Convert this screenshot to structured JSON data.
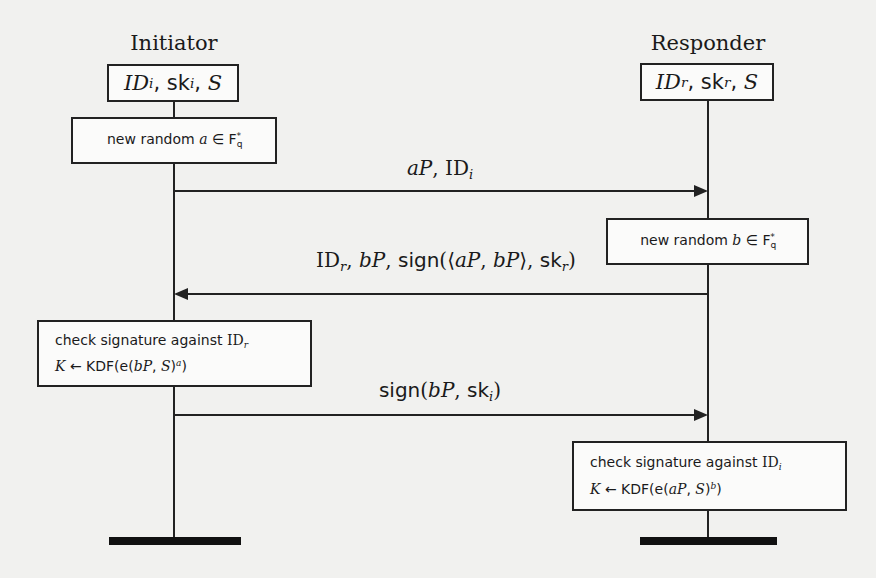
{
  "diagram": {
    "type": "protocol-sequence",
    "colors": {
      "background": "#f1f1ef",
      "line": "#222222",
      "box_fill": "#fbfbfa"
    },
    "initiator": {
      "title": "Initiator",
      "state": {
        "id": "ID",
        "id_sub": "i",
        "sk": "sk",
        "sk_sub": "i",
        "s": "S",
        "display": "IDi, ski, S"
      },
      "step1": {
        "text": "new random",
        "var": "a",
        "in": "∈",
        "field": "F",
        "field_sub": "q",
        "field_sup": "*",
        "display": "new random a ∈ Fq*"
      },
      "step2": {
        "line1": {
          "text": "check signature against",
          "id": "ID",
          "id_sub": "r"
        },
        "line2": {
          "k": "K",
          "arrow": "←",
          "kdf": "KDF(e(",
          "arg1": "bP",
          "sep": ", ",
          "arg2": "S",
          "close": ")",
          "exp": "a",
          "end": ")"
        },
        "display": "check signature against IDr; K ← KDF(e(bP, S)^a)"
      }
    },
    "responder": {
      "title": "Responder",
      "state": {
        "id": "ID",
        "id_sub": "r",
        "sk": "sk",
        "sk_sub": "r",
        "s": "S",
        "display": "IDr, skr, S"
      },
      "step1": {
        "text": "new random",
        "var": "b",
        "in": "∈",
        "field": "F",
        "field_sub": "q",
        "field_sup": "*",
        "display": "new random b ∈ Fq*"
      },
      "step2": {
        "line1": {
          "text": "check signature against",
          "id": "ID",
          "id_sub": "i"
        },
        "line2": {
          "k": "K",
          "arrow": "←",
          "kdf": "KDF(e(",
          "arg1": "aP",
          "sep": ", ",
          "arg2": "S",
          "close": ")",
          "exp": "b",
          "end": ")"
        },
        "display": "check signature against IDi; K ← KDF(e(aP, S)^b)"
      }
    },
    "messages": [
      {
        "direction": "initiator-to-responder",
        "p1": "aP",
        "sep": ", ",
        "id": "ID",
        "id_sub": "i",
        "display": "aP, IDi"
      },
      {
        "direction": "responder-to-initiator",
        "id": "ID",
        "id_sub": "r",
        "sep1": ", ",
        "bp": "bP",
        "sep2": ", ",
        "sign": "sign",
        "open": "(⟨",
        "ap": "aP",
        "comma": ", ",
        "bp2": "bP",
        "close_angle": "⟩, ",
        "sk": "sk",
        "sk_sub": "r",
        "close": ")",
        "display": "IDr, bP, sign(⟨aP, bP⟩, skr)"
      },
      {
        "direction": "initiator-to-responder",
        "sign": "sign",
        "open": "(",
        "bp": "bP",
        "comma": ", ",
        "sk": "sk",
        "sk_sub": "i",
        "close": ")",
        "display": "sign(bP, ski)"
      }
    ]
  }
}
